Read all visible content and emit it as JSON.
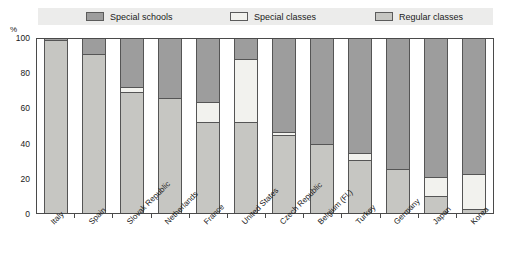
{
  "legend": {
    "entries": [
      {
        "label": "Special schools",
        "color": "#9d9d9d",
        "key": "special_schools"
      },
      {
        "label": "Special classes",
        "color": "#f2f2ee",
        "key": "special_classes"
      },
      {
        "label": "Regular classes",
        "color": "#c6c6c2",
        "key": "regular_classes"
      }
    ]
  },
  "axis": {
    "y_unit": "%",
    "y_ticks": [
      "0",
      "20",
      "40",
      "60",
      "80",
      "100"
    ]
  },
  "chart_data": {
    "type": "bar",
    "title": "",
    "subtitle": "",
    "xlabel": "",
    "ylabel": "%",
    "ylim": [
      0,
      100
    ],
    "grid": false,
    "stacked": true,
    "stack_total": 100,
    "legend_position": "top",
    "orientation": "vertical",
    "categories": [
      "Italy",
      "Spain",
      "Slovak Republic",
      "Netherlands",
      "France",
      "United States",
      "Czech Republic",
      "Belgium (Fl.)",
      "Turkey",
      "Germany",
      "Japan",
      "Korea"
    ],
    "series": [
      {
        "name": "Special schools",
        "color": "#9d9d9d",
        "values": [
          1,
          9,
          28,
          34.5,
          37,
          12,
          54,
          61,
          66,
          75,
          80,
          78
        ]
      },
      {
        "name": "Special classes",
        "color": "#f2f2ee",
        "values": [
          0,
          0,
          3,
          0,
          11,
          36,
          2,
          0,
          4,
          0,
          11,
          20
        ]
      },
      {
        "name": "Regular classes",
        "color": "#c6c6c2",
        "values": [
          99,
          91,
          69,
          65.5,
          52,
          52,
          44,
          39,
          30,
          25,
          9,
          2
        ]
      }
    ]
  }
}
